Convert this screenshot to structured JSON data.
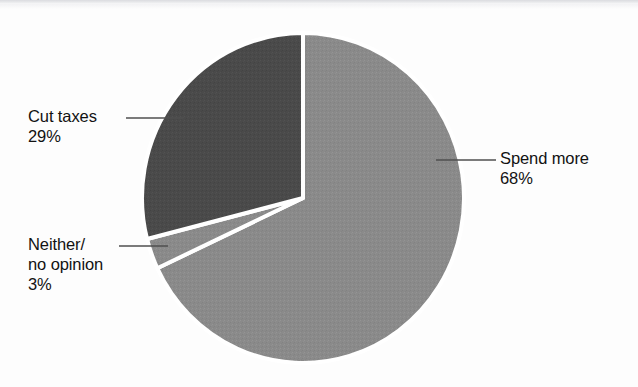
{
  "chart_data": {
    "type": "pie",
    "title": "",
    "subtitle": "",
    "xlabel": "",
    "ylabel": "",
    "legend_position": "none",
    "grid": false,
    "categories": [
      "Spend more",
      "Neither/ no opinion",
      "Cut taxes"
    ],
    "values": [
      68,
      3,
      29
    ],
    "units": "%",
    "slices": [
      {
        "label": "Spend more",
        "label_line1": "Spend more",
        "value": 68,
        "value_text": "68%",
        "color": "#8a8a8a",
        "start_angle_deg": 0,
        "end_angle_deg": 244.8,
        "label_position": "right"
      },
      {
        "label": "Neither/ no opinion",
        "label_line1": "Neither/",
        "label_line2": "no opinion",
        "value": 3,
        "value_text": "3%",
        "color": "#8a8a8a",
        "start_angle_deg": 244.8,
        "end_angle_deg": 255.6,
        "label_position": "left"
      },
      {
        "label": "Cut taxes",
        "label_line1": "Cut taxes",
        "value": 29,
        "value_text": "29%",
        "color": "#4a4a4a",
        "start_angle_deg": 255.6,
        "end_angle_deg": 360,
        "label_position": "left"
      }
    ],
    "colors": {
      "spend_more": "#8a8a8a",
      "neither_no_opinion": "#8a8a8a",
      "cut_taxes": "#4a4a4a",
      "separator": "#ffffff",
      "background": "#fdfdfd",
      "text": "#121212",
      "leader_line": "#4f4f4f"
    }
  },
  "labels": {
    "cut_taxes": {
      "name": "Cut taxes",
      "percent": "29%"
    },
    "neither": {
      "line1": "Neither/",
      "line2": "no opinion",
      "percent": "3%"
    },
    "spend_more": {
      "name": "Spend more",
      "percent": "68%"
    }
  }
}
